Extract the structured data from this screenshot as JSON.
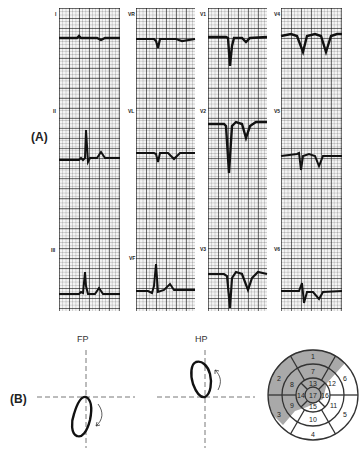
{
  "panel_a": {
    "label": "(A)",
    "leads": [
      {
        "name": "I",
        "col": 0,
        "row": 0
      },
      {
        "name": "II",
        "col": 0,
        "row": 1
      },
      {
        "name": "III",
        "col": 0,
        "row": 2
      },
      {
        "name": "VR",
        "col": 1,
        "row": 0
      },
      {
        "name": "VL",
        "col": 1,
        "row": 1
      },
      {
        "name": "VF",
        "col": 1,
        "row": 2
      },
      {
        "name": "V1",
        "col": 2,
        "row": 0
      },
      {
        "name": "V2",
        "col": 2,
        "row": 1
      },
      {
        "name": "V3",
        "col": 2,
        "row": 2
      },
      {
        "name": "V4",
        "col": 3,
        "row": 0
      },
      {
        "name": "V5",
        "col": 3,
        "row": 1
      },
      {
        "name": "V6",
        "col": 3,
        "row": 2
      }
    ],
    "labels": {
      "I": "I",
      "II": "II",
      "III": "III",
      "VR": "VR",
      "VL": "VL",
      "VF": "VF",
      "V1": "V1",
      "V2": "V2",
      "V3": "V3",
      "V4": "V4",
      "V5": "V5",
      "V6": "V6"
    }
  },
  "panel_b": {
    "label": "(B)",
    "fp_label": "FP",
    "hp_label": "HP",
    "bullseye": {
      "outer_ring": [
        "1",
        "6",
        "5",
        "4",
        "3",
        "2"
      ],
      "middle_ring": [
        "7",
        "12",
        "11",
        "10",
        "9",
        "8"
      ],
      "inner_ring": [
        "13",
        "16",
        "15",
        "14"
      ],
      "apex": "17",
      "shaded_color": "#a9a9a9",
      "shaded_segments": [
        "1",
        "2",
        "3",
        "7",
        "8",
        "9",
        "12",
        "13",
        "14",
        "16",
        "17"
      ]
    }
  }
}
